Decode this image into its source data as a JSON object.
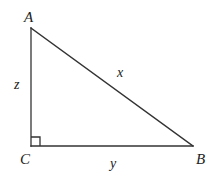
{
  "figure": {
    "background_color": "#ffffff",
    "stroke_color": "#333333",
    "text_color": "#222222",
    "stroke_width": 1.3
  },
  "vertices": [
    {
      "id": "A",
      "label": "A",
      "x": 31,
      "y": 28
    },
    {
      "id": "B",
      "label": "B",
      "x": 193,
      "y": 146
    },
    {
      "id": "C",
      "label": "C",
      "x": 31,
      "y": 146
    }
  ],
  "sides": [
    {
      "id": "hypotenuse",
      "label": "x",
      "from": "A",
      "to": "B"
    },
    {
      "id": "base",
      "label": "y",
      "from": "C",
      "to": "B"
    },
    {
      "id": "vertical",
      "label": "z",
      "from": "A",
      "to": "C"
    }
  ],
  "right_angle": {
    "at_vertex": "C",
    "marker": "square",
    "size": 9
  }
}
